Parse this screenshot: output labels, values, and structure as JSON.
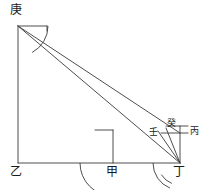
{
  "figure": {
    "stroke_color": "#3a3a3a",
    "label_color": "#1a1a1a",
    "background_color": "#ffffff",
    "stroke_width": 0.9
  },
  "labels": {
    "geng": "庚",
    "yi": "乙",
    "jia": "甲",
    "ding": "丁",
    "bing": "丙",
    "ren": "壬",
    "gui": "癸"
  },
  "points": {
    "geng": {
      "x": 18,
      "y": 26,
      "label_x": 10,
      "label_y": 4
    },
    "yi": {
      "x": 18,
      "y": 163,
      "label_x": 10,
      "label_y": 166
    },
    "jia": {
      "x": 113,
      "y": 163,
      "label_x": 106,
      "label_y": 166
    },
    "ding": {
      "x": 180,
      "y": 163,
      "label_x": 173,
      "label_y": 166
    },
    "bing": {
      "x": 180,
      "y": 133,
      "label_x": 189,
      "label_y": 127
    },
    "ren": {
      "x": 161,
      "y": 133,
      "label_x": 150,
      "label_y": 128
    },
    "gui": {
      "x": 172,
      "y": 126,
      "label_x": 168,
      "label_y": 120
    }
  },
  "segments": [
    {
      "name": "geng-yi-vertical",
      "x1": 18,
      "y1": 26,
      "x2": 18,
      "y2": 163
    },
    {
      "name": "yi-ding-baseline",
      "x1": 18,
      "y1": 163,
      "x2": 180,
      "y2": 163
    },
    {
      "name": "geng-ding-hypotenuse",
      "x1": 18,
      "y1": 26,
      "x2": 180,
      "y2": 163
    },
    {
      "name": "geng-ren-sightline",
      "x1": 18,
      "y1": 26,
      "x2": 180,
      "y2": 133
    },
    {
      "name": "geng-top-guide",
      "x1": 18,
      "y1": 26,
      "x2": 47,
      "y2": 26
    },
    {
      "name": "geng-guide-tick",
      "x1": 47,
      "y1": 26,
      "x2": 47,
      "y2": 31
    },
    {
      "name": "jia-vertical-gnomon",
      "x1": 113,
      "y1": 163,
      "x2": 113,
      "y2": 130
    },
    {
      "name": "jia-top-guide",
      "x1": 95,
      "y1": 130,
      "x2": 113,
      "y2": 130
    },
    {
      "name": "ding-bing-vertical",
      "x1": 180,
      "y1": 163,
      "x2": 180,
      "y2": 126
    },
    {
      "name": "ren-bing-horizontal",
      "x1": 161,
      "y1": 133,
      "x2": 188,
      "y2": 133
    },
    {
      "name": "gui-top-guide",
      "x1": 166,
      "y1": 126,
      "x2": 188,
      "y2": 126
    },
    {
      "name": "ding-ren-sightline",
      "x1": 180,
      "y1": 163,
      "x2": 158,
      "y2": 131
    },
    {
      "name": "ding-gui-sightline",
      "x1": 180,
      "y1": 163,
      "x2": 166,
      "y2": 128
    }
  ],
  "arcs": [
    {
      "name": "geng-angle-arc",
      "cx": 18,
      "cy": 26,
      "r": 30,
      "start_deg": 0,
      "end_deg": 62
    },
    {
      "name": "jia-angle-arc",
      "cx": 113,
      "cy": 163,
      "r": 33,
      "start_deg": 180,
      "end_deg": 90
    },
    {
      "name": "ding-angle-arc",
      "cx": 180,
      "cy": 163,
      "r": 27,
      "start_deg": 180,
      "end_deg": 112
    },
    {
      "name": "ding-inner-arc",
      "cx": 180,
      "cy": 163,
      "r": 22,
      "start_deg": 148,
      "end_deg": 112
    }
  ]
}
